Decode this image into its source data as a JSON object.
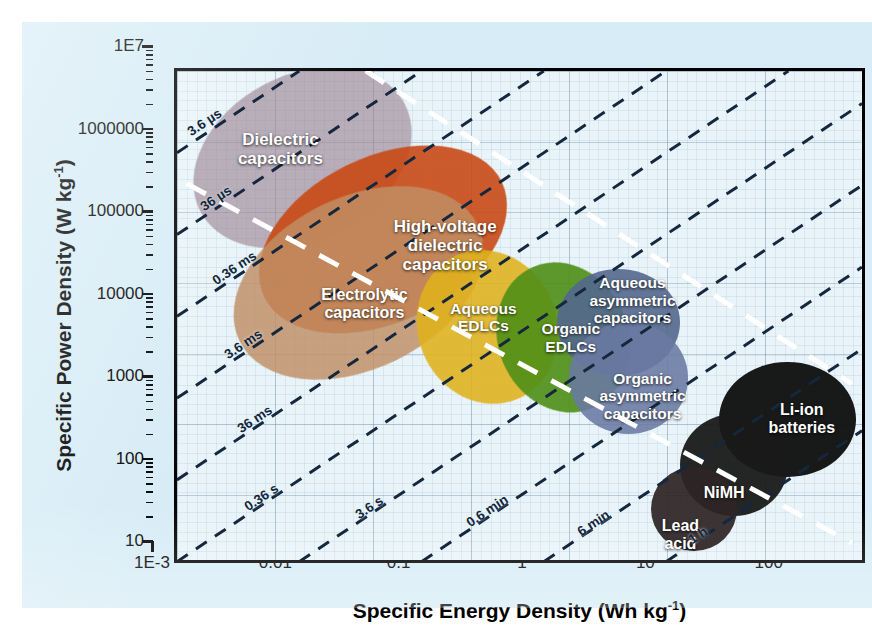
{
  "figure": {
    "type": "ragone-plot",
    "background_color": "#d7ecf6",
    "plot_background_color": "#e8f4fa"
  },
  "axes": {
    "x": {
      "title_main": "Specific Energy Density (Wh kg",
      "title_exp": "-1",
      "title_close": ")",
      "ticks": [
        "1E-3",
        "0.01",
        "0.1",
        "1",
        "10",
        "100"
      ],
      "min": 0.001,
      "max": 400,
      "scale": "log"
    },
    "y": {
      "title_main": "Specific Power Density (W kg",
      "title_exp": "-1",
      "title_close": ")",
      "ticks": [
        "1E7",
        "1000000",
        "100000",
        "10000",
        "1000",
        "100",
        "10"
      ],
      "min": 10,
      "max": 10000000,
      "scale": "log"
    }
  },
  "chart_data": {
    "type": "scatter",
    "title": "",
    "xlabel": "Specific Energy Density (Wh kg-1)",
    "ylabel": "Specific Power Density (W kg-1)",
    "xlim": [
      0.001,
      400
    ],
    "ylim": [
      10,
      10000000
    ],
    "xscale": "log",
    "yscale": "log",
    "grid": true,
    "legend": "none",
    "regions": [
      {
        "label": "Dielectric capacitors",
        "color": "#9b8392",
        "opacity": 0.62,
        "x_range": [
          0.0012,
          0.09
        ],
        "y_range": [
          90000,
          9000000
        ],
        "rotation_deg": -28
      },
      {
        "label": "High-voltage dielectric capacitors",
        "color": "#c94a16",
        "opacity": 0.9,
        "x_range": [
          0.004,
          0.55
        ],
        "y_range": [
          9000,
          900000
        ],
        "rotation_deg": -26
      },
      {
        "label": "Electrolytic capacitors",
        "color": "#c09065",
        "opacity": 0.82,
        "x_range": [
          0.0025,
          0.35
        ],
        "y_range": [
          2500,
          300000
        ],
        "rotation_deg": -26
      },
      {
        "label": "Aqueous EDLCs",
        "color": "#e0b21c",
        "opacity": 0.88,
        "x_range": [
          0.09,
          1.2
        ],
        "y_range": [
          900,
          70000
        ],
        "rotation_deg": -22
      },
      {
        "label": "Organic EDLCs",
        "color": "#4f8f17",
        "opacity": 0.9,
        "x_range": [
          0.4,
          4.5
        ],
        "y_range": [
          700,
          50000
        ],
        "rotation_deg": -22
      },
      {
        "label": "Aqueous asymmetric capacitors",
        "color": "#55698e",
        "opacity": 0.9,
        "x_range": [
          1.2,
          12
        ],
        "y_range": [
          2000,
          40000
        ],
        "rotation_deg": 0
      },
      {
        "label": "Organic asymmetric capacitors",
        "color": "#6a7aa3",
        "opacity": 0.88,
        "x_range": [
          1.5,
          14
        ],
        "y_range": [
          400,
          9000
        ],
        "rotation_deg": 0
      },
      {
        "label": "Li-ion batteries",
        "color": "#121212",
        "opacity": 0.97,
        "x_range": [
          25,
          320
        ],
        "y_range": [
          120,
          3000
        ],
        "rotation_deg": 0
      },
      {
        "label": "NiMH",
        "color": "#1a1a1a",
        "opacity": 0.95,
        "x_range": [
          12,
          90
        ],
        "y_range": [
          40,
          700
        ],
        "rotation_deg": 0
      },
      {
        "label": "Lead acid",
        "color": "#2e2526",
        "opacity": 0.93,
        "x_range": [
          7,
          35
        ],
        "y_range": [
          15,
          160
        ],
        "rotation_deg": 0
      }
    ],
    "isolines": [
      {
        "label": "3.6 µs",
        "time_s": 3.6e-06
      },
      {
        "label": "36 µs",
        "time_s": 3.6e-05
      },
      {
        "label": "0.36 ms",
        "time_s": 0.00036
      },
      {
        "label": "3.6 ms",
        "time_s": 0.0036
      },
      {
        "label": "36 ms",
        "time_s": 0.036
      },
      {
        "label": "0.36 s",
        "time_s": 0.36
      },
      {
        "label": "3.6 s",
        "time_s": 3.6
      },
      {
        "label": "0.6 min",
        "time_s": 36
      },
      {
        "label": "6 min",
        "time_s": 360
      },
      {
        "label": "1 h",
        "time_s": 3600
      }
    ],
    "isoline_style": {
      "color": "#15273d",
      "dash": "dashed"
    },
    "trend_line": {
      "color": "#ffffff",
      "dash": "dashed",
      "note": "descending white dashed boundary"
    }
  },
  "blob_labels": {
    "dielectric": "Dielectric\ncapacitors",
    "hv_dielectric": "High-voltage\ndielectric\ncapacitors",
    "electrolytic": "Electrolytic\ncapacitors",
    "aqueous_edlc": "Aqueous\nEDLCs",
    "organic_edlc": "Organic\nEDLCs",
    "aqueous_asym": "Aqueous\nasymmetric\ncapacitors",
    "organic_asym": "Organic\nasymmetric\ncapacitors",
    "liion": "Li-ion\nbatteries",
    "nimh": "NiMH",
    "lead_acid": "Lead\nacid"
  }
}
